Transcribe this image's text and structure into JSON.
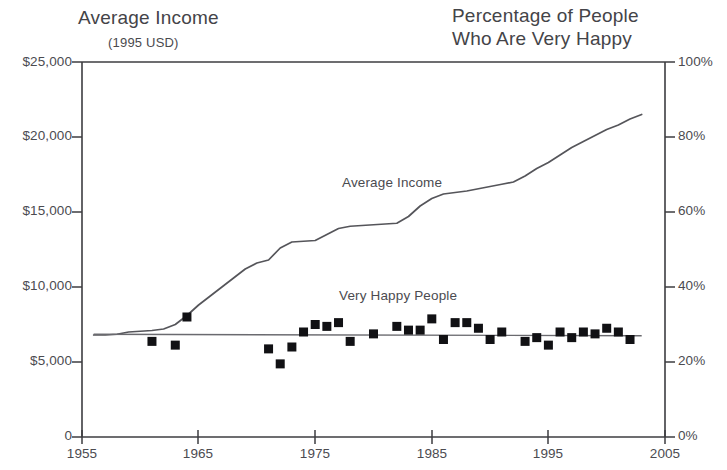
{
  "titles": {
    "left_title": "Average Income",
    "left_subtitle": "(1995 USD)",
    "right_title_line1": "Percentage of People",
    "right_title_line2": "Who Are Very Happy"
  },
  "series_labels": {
    "income": "Average Income",
    "happy": "Very Happy People"
  },
  "axes": {
    "left_ticks": [
      "$25,000",
      "$20,000",
      "$15,000",
      "$10,000",
      "$5,000",
      "0"
    ],
    "right_ticks": [
      "100%",
      "80%",
      "60%",
      "40%",
      "20%",
      "0%"
    ],
    "x_ticks": [
      "1955",
      "1965",
      "1975",
      "1985",
      "1995",
      "2005"
    ]
  },
  "colors": {
    "axis": "#3d3d40",
    "line": "#55555a",
    "marker": "#111114",
    "text": "#4b4b50",
    "background": "#ffffff"
  },
  "chart_data": {
    "type": "line",
    "xlabel": "",
    "ylabel": "Average Income (1995 USD)",
    "ylabel_right": "Percentage of People Who Are Very Happy",
    "xlim": [
      1955,
      2005
    ],
    "ylim": [
      0,
      25000
    ],
    "ylim_right": [
      0,
      100
    ],
    "grid": false,
    "legend": "inline-annotations",
    "series": [
      {
        "name": "Average Income",
        "type": "line",
        "axis": "left",
        "units": "1995 USD",
        "x": [
          1956,
          1957,
          1958,
          1959,
          1960,
          1961,
          1962,
          1963,
          1964,
          1965,
          1966,
          1967,
          1968,
          1969,
          1970,
          1971,
          1972,
          1973,
          1974,
          1975,
          1976,
          1977,
          1978,
          1979,
          1980,
          1981,
          1982,
          1983,
          1984,
          1985,
          1986,
          1987,
          1988,
          1989,
          1990,
          1991,
          1992,
          1993,
          1994,
          1995,
          1996,
          1997,
          1998,
          1999,
          2000,
          2001,
          2002,
          2003
        ],
        "y": [
          6800,
          6800,
          6850,
          7000,
          7050,
          7100,
          7200,
          7500,
          8100,
          8800,
          9400,
          10000,
          10600,
          11200,
          11600,
          11800,
          12600,
          13000,
          13050,
          13100,
          13500,
          13900,
          14050,
          14100,
          14150,
          14200,
          14250,
          14700,
          15400,
          15900,
          16200,
          16300,
          16400,
          16550,
          16700,
          16850,
          17000,
          17400,
          17900,
          18300,
          18800,
          19300,
          19700,
          20100,
          20500,
          20800,
          21200,
          21500
        ]
      },
      {
        "name": "Very Happy People",
        "type": "scatter",
        "axis": "right",
        "units": "percent",
        "x": [
          1961,
          1963,
          1964,
          1971,
          1972,
          1973,
          1974,
          1975,
          1976,
          1977,
          1978,
          1980,
          1982,
          1983,
          1984,
          1985,
          1986,
          1987,
          1988,
          1989,
          1990,
          1991,
          1993,
          1994,
          1995,
          1996,
          1997,
          1998,
          1999,
          2000,
          2001,
          2002
        ],
        "y": [
          25.5,
          24.5,
          32.0,
          23.5,
          19.5,
          24.0,
          28.0,
          30.0,
          29.5,
          30.5,
          25.5,
          27.5,
          29.5,
          28.5,
          28.5,
          31.5,
          26.0,
          30.5,
          30.5,
          29.0,
          26.0,
          28.0,
          25.5,
          26.5,
          24.5,
          28.0,
          26.5,
          28.0,
          27.5,
          29.0,
          28.0,
          26.0
        ]
      },
      {
        "name": "Very Happy People trend",
        "type": "line",
        "axis": "right",
        "x": [
          1956,
          2003
        ],
        "y": [
          27.4,
          27.0
        ]
      }
    ]
  }
}
